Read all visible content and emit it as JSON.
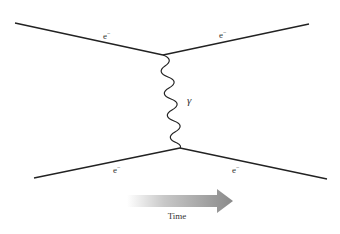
{
  "diagram": {
    "type": "feynman",
    "colors": {
      "line": "#222222",
      "text": "#333333",
      "arrow_start": "#ffffff",
      "arrow_end": "#8a8a8a"
    },
    "vertices": [
      {
        "id": "top",
        "x": 163,
        "y": 55
      },
      {
        "id": "bottom",
        "x": 180,
        "y": 148
      }
    ],
    "fermion_lines": [
      {
        "from": [
          15,
          23
        ],
        "to": [
          163,
          55
        ],
        "label": "e",
        "charge": "−",
        "label_pos": [
          103,
          39
        ]
      },
      {
        "from": [
          163,
          55
        ],
        "to": [
          309,
          24
        ],
        "label": "e",
        "charge": "−",
        "label_pos": [
          219,
          38
        ]
      },
      {
        "from": [
          34,
          178
        ],
        "to": [
          180,
          148
        ],
        "label": "e",
        "charge": "−",
        "label_pos": [
          113,
          173
        ]
      },
      {
        "from": [
          180,
          148
        ],
        "to": [
          327,
          179
        ],
        "label": "e",
        "charge": "−",
        "label_pos": [
          232,
          173
        ]
      }
    ],
    "photon": {
      "label": "γ",
      "label_pos": [
        187,
        104
      ]
    },
    "time_arrow": {
      "label": "Time"
    }
  }
}
